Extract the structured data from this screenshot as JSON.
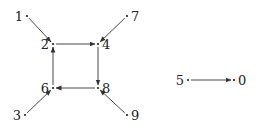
{
  "diagram": {
    "type": "directed-graph",
    "colors": {
      "edge": "#333333",
      "text": "#222222",
      "background": "#ffffff"
    },
    "nodes": [
      {
        "id": "0",
        "label": "0",
        "x": 234,
        "y": 80,
        "label_dx": 4,
        "anchor": "start"
      },
      {
        "id": "1",
        "label": "1",
        "x": 27,
        "y": 16,
        "label_dx": -4,
        "anchor": "end"
      },
      {
        "id": "2",
        "label": "2",
        "x": 53,
        "y": 44,
        "label_dx": -4,
        "anchor": "end"
      },
      {
        "id": "3",
        "label": "3",
        "x": 25,
        "y": 115,
        "label_dx": -4,
        "anchor": "end"
      },
      {
        "id": "4",
        "label": "4",
        "x": 98,
        "y": 44,
        "label_dx": 4,
        "anchor": "start"
      },
      {
        "id": "5",
        "label": "5",
        "x": 188,
        "y": 80,
        "label_dx": -4,
        "anchor": "end"
      },
      {
        "id": "6",
        "label": "6",
        "x": 53,
        "y": 88,
        "label_dx": -4,
        "anchor": "end"
      },
      {
        "id": "7",
        "label": "7",
        "x": 127,
        "y": 16,
        "label_dx": 4,
        "anchor": "start"
      },
      {
        "id": "8",
        "label": "8",
        "x": 98,
        "y": 88,
        "label_dx": 4,
        "anchor": "start"
      },
      {
        "id": "9",
        "label": "9",
        "x": 127,
        "y": 115,
        "label_dx": 4,
        "anchor": "start"
      }
    ],
    "edges": [
      {
        "from": "1",
        "to": "2"
      },
      {
        "from": "2",
        "to": "4"
      },
      {
        "from": "7",
        "to": "4"
      },
      {
        "from": "4",
        "to": "8"
      },
      {
        "from": "8",
        "to": "6"
      },
      {
        "from": "6",
        "to": "2"
      },
      {
        "from": "3",
        "to": "6"
      },
      {
        "from": "9",
        "to": "8"
      },
      {
        "from": "5",
        "to": "0"
      }
    ]
  }
}
